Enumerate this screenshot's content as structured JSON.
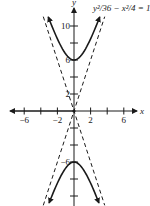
{
  "chart_data": {
    "type": "line",
    "title": "",
    "equation": "y²/36 − x²/4 = 1",
    "xlabel": "x",
    "ylabel": "y",
    "xlim": [
      -8,
      8
    ],
    "ylim": [
      -11.5,
      12
    ],
    "grid": false,
    "x_ticks": [
      -6,
      -4,
      -2,
      0,
      2,
      4,
      6
    ],
    "x_tick_labels": [
      "−6",
      "−2",
      "2",
      "6"
    ],
    "x_tick_label_values": [
      -6,
      -2,
      2,
      6
    ],
    "y_ticks": [
      -10,
      -8,
      -6,
      -4,
      -2,
      2,
      4,
      6,
      8,
      10
    ],
    "y_tick_labels": [
      "10",
      "6",
      "2",
      "−6"
    ],
    "y_tick_label_values": [
      10,
      6,
      2,
      -6
    ],
    "series": [
      {
        "name": "upper branch",
        "style": "solid",
        "function": "y = 6*sqrt(1 + x^2/4)",
        "vertex": [
          0,
          6
        ],
        "x": [
          -3.1,
          -2,
          -1,
          0,
          1,
          2,
          3.1
        ],
        "y": [
          11.06,
          8.49,
          6.71,
          6,
          6.71,
          8.49,
          11.06
        ]
      },
      {
        "name": "lower branch",
        "style": "solid",
        "function": "y = -6*sqrt(1 + x^2/4)",
        "vertex": [
          0,
          -6
        ],
        "x": [
          -3.0,
          -2,
          -1,
          0,
          1,
          2,
          3.0
        ],
        "y": [
          -10.8,
          -8.49,
          -6.71,
          -6,
          -6.71,
          -8.49,
          -10.8
        ]
      },
      {
        "name": "asymptote y = 3x",
        "style": "dashed",
        "x": [
          -3.7,
          3.7
        ],
        "y": [
          -11.1,
          11.1
        ]
      },
      {
        "name": "asymptote y = -3x",
        "style": "dashed",
        "x": [
          -3.7,
          3.7
        ],
        "y": [
          11.1,
          -11.1
        ]
      }
    ],
    "annotations": [
      {
        "text": "y²/36 − x²/4 = 1",
        "position": "top-right"
      }
    ]
  },
  "labels": {
    "equation": "y²/36 − x²/4 = 1",
    "x_axis": "x",
    "y_axis": "y"
  },
  "colors": {
    "ink": "#1a1a1a",
    "background": "#ffffff"
  }
}
